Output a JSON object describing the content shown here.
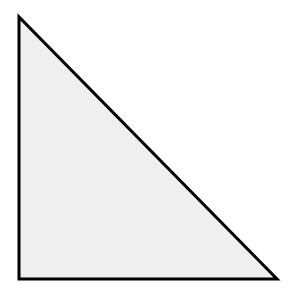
{
  "diagram": {
    "shape": "right-triangle",
    "vertices": {
      "top": [
        19,
        17
      ],
      "bottom_left": [
        19,
        279
      ],
      "bottom_right": [
        277,
        279
      ]
    },
    "fill_color": "#efefef",
    "stroke_color": "#000000",
    "stroke_width": 3,
    "background_color": "#ffffff"
  }
}
